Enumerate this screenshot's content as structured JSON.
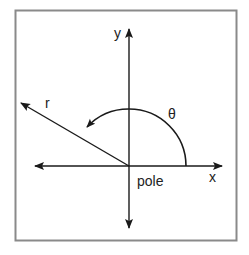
{
  "diagram": {
    "labels": {
      "y_axis": "y",
      "x_axis": "x",
      "radius": "r",
      "angle": "θ",
      "origin": "pole"
    },
    "colors": {
      "frame": "#8a8a8a",
      "stroke": "#1a1a1a",
      "background": "#ffffff"
    },
    "geometry": {
      "frame": {
        "x": 15,
        "y": 10,
        "width": 222,
        "height": 231
      },
      "origin": {
        "x": 129,
        "y": 166
      },
      "x_axis": {
        "x1": 35,
        "x2": 222
      },
      "y_axis": {
        "y1": 30,
        "y2": 227
      },
      "r_end": {
        "x": 21,
        "y": 103
      },
      "arc_radius": 57
    }
  }
}
